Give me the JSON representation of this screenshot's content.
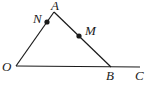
{
  "diagram": {
    "type": "geometry",
    "points": {
      "O": {
        "label": "O",
        "x": 16,
        "y": 66
      },
      "A": {
        "label": "A",
        "x": 54,
        "y": 12
      },
      "B": {
        "label": "B",
        "x": 111,
        "y": 67
      },
      "C": {
        "label": "C",
        "x": 140,
        "y": 67
      },
      "N": {
        "label": "N",
        "x": 47,
        "y": 22
      },
      "M": {
        "label": "M",
        "x": 79,
        "y": 36
      }
    },
    "segments": [
      "OA",
      "AB",
      "OC"
    ],
    "marked_points": [
      "N",
      "M"
    ],
    "stroke_color": "#1a1a1a"
  }
}
